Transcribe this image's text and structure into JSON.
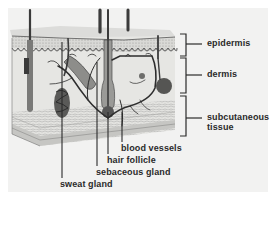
{
  "diagram": {
    "layer_labels": [
      {
        "id": "epidermis",
        "text": "epidermis"
      },
      {
        "id": "dermis",
        "text": "dermis"
      },
      {
        "id": "subcutaneous",
        "text_line1": "subcutaneous",
        "text_line2": "tissue"
      }
    ],
    "structure_labels": [
      {
        "id": "blood-vessels",
        "text": "blood vessels"
      },
      {
        "id": "hair-follicle",
        "text": "hair follicle"
      },
      {
        "id": "sebaceous-gland",
        "text": "sebaceous gland"
      },
      {
        "id": "sweat-gland",
        "text": "sweat gland"
      }
    ]
  }
}
